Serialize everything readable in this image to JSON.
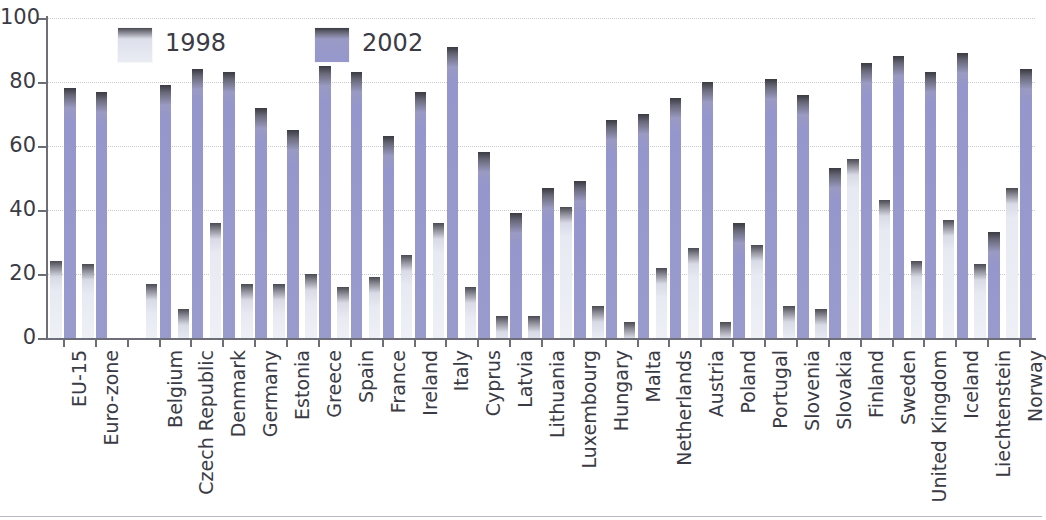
{
  "legend": {
    "position": "top-left-inside",
    "items": [
      {
        "label": "1998",
        "color": "#e9ecf3",
        "swatch": "legend-swatch-1998"
      },
      {
        "label": "2002",
        "color": "#9698cd",
        "swatch": "legend-swatch-2002"
      }
    ]
  },
  "axes": {
    "y_ticks": [
      "0",
      "20",
      "40",
      "60",
      "80",
      "100"
    ],
    "x_tick_count": 31
  },
  "chart_data": {
    "type": "bar",
    "title": "",
    "subtitle": "",
    "xlabel": "",
    "ylabel": "",
    "ylim": [
      0,
      100
    ],
    "ytick_values": [
      0,
      20,
      40,
      60,
      80,
      100
    ],
    "grid": true,
    "grid_axis": "y",
    "grid_style": "dotted",
    "legend_position": "upper left (inside plot)",
    "orientation": "vertical",
    "group_gap_after": "Euro-zone",
    "categories": [
      "EU-15",
      "Euro-zone",
      "Belgium",
      "Czech Republic",
      "Denmark",
      "Germany",
      "Estonia",
      "Greece",
      "Spain",
      "France",
      "Ireland",
      "Italy",
      "Cyprus",
      "Latvia",
      "Lithuania",
      "Luxembourg",
      "Hungary",
      "Malta",
      "Netherlands",
      "Austria",
      "Poland",
      "Portugal",
      "Slovenia",
      "Slovakia",
      "Finland",
      "Sweden",
      "United Kingdom",
      "Iceland",
      "Liechtenstein",
      "Norway"
    ],
    "series": [
      {
        "name": "1998",
        "color": "#e9ecf3",
        "values": [
          24,
          23,
          17,
          9,
          36,
          17,
          17,
          20,
          16,
          19,
          26,
          36,
          16,
          7,
          7,
          41,
          10,
          5,
          22,
          28,
          5,
          29,
          10,
          9,
          56,
          43,
          24,
          37,
          23,
          47
        ]
      },
      {
        "name": "2002",
        "color": "#9698cd",
        "values": [
          78,
          77,
          79,
          84,
          83,
          72,
          65,
          85,
          83,
          63,
          77,
          91,
          58,
          39,
          47,
          49,
          68,
          70,
          75,
          80,
          36,
          81,
          76,
          53,
          86,
          88,
          83,
          89,
          33,
          84
        ]
      }
    ]
  }
}
